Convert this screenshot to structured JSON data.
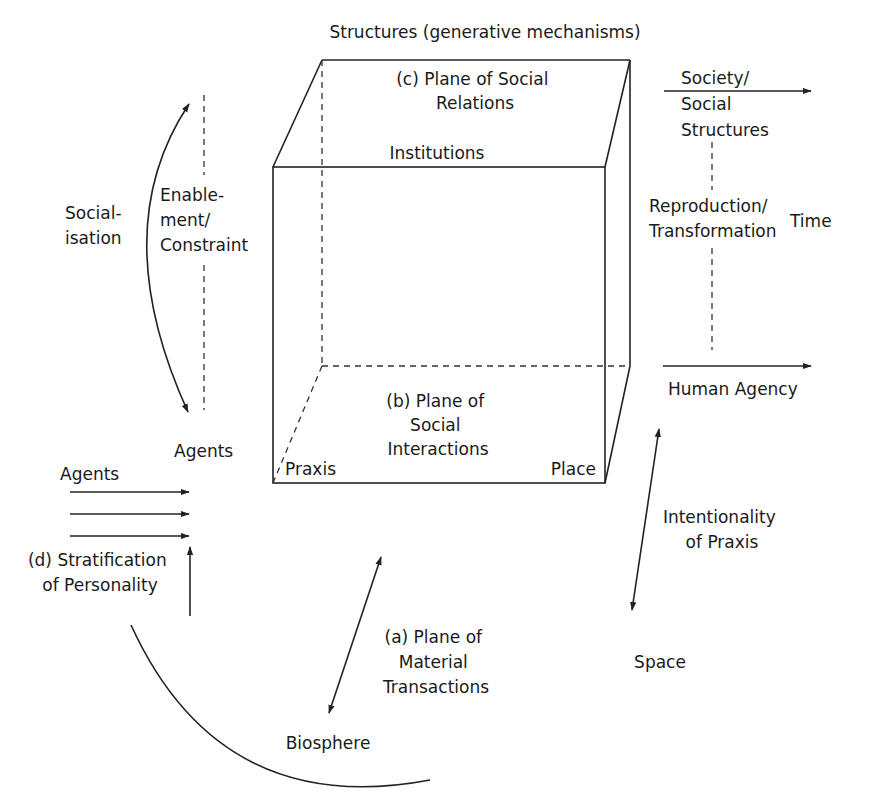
{
  "diagram": {
    "title": "Structures (generative mechanisms)",
    "cube": {
      "top_plane": {
        "line1": "(c) Plane of Social",
        "line2": "Relations"
      },
      "front_top_label": "Institutions",
      "bottom_plane": {
        "line1": "(b) Plane of",
        "line2": "Social",
        "line3": "Interactions"
      },
      "bottom_left_label": "Praxis",
      "bottom_right_label": "Place"
    },
    "left": {
      "socialisation": {
        "line1": "Social-",
        "line2": "isation"
      },
      "enablement": {
        "line1": "Enable-",
        "line2": "ment/",
        "line3": "Constraint"
      },
      "agents_top": "Agents",
      "agents_left": "Agents",
      "stratification": {
        "line1": "(d) Stratification",
        "line2": "of Personality"
      }
    },
    "right": {
      "society": {
        "line1": "Society/",
        "line2": "Social",
        "line3": "Structures"
      },
      "reproduction": {
        "line1": "Reproduction/",
        "line2": "Transformation"
      },
      "time": "Time",
      "human_agency": "Human Agency",
      "intentionality": {
        "line1": "Intentionality",
        "line2": "of Praxis"
      },
      "space": "Space"
    },
    "bottom": {
      "material": {
        "line1": "(a) Plane of",
        "line2": "Material",
        "line3": "Transactions"
      },
      "biosphere": "Biosphere"
    }
  }
}
